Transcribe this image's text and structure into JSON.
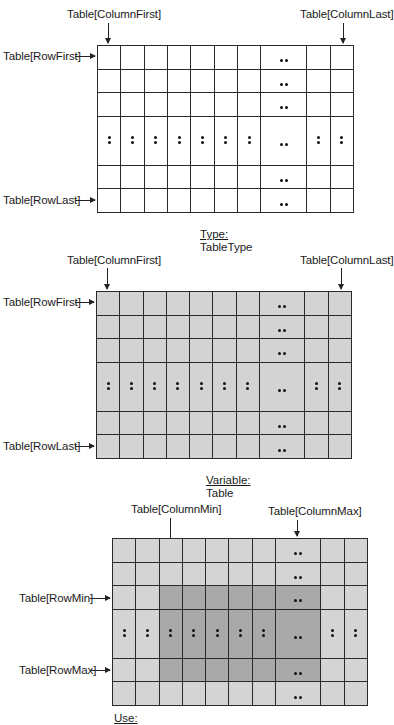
{
  "diagrams": [
    {
      "caption": {
        "kind": "Type:",
        "name": "TableType"
      },
      "labels": {
        "column_first": "Table[ColumnFirst]",
        "column_last": "Table[ColumnLast]",
        "row_first": "Table[RowFirst]",
        "row_last": "Table[RowLast]"
      },
      "fill": "#ffffff"
    },
    {
      "caption": {
        "kind": "Variable:",
        "name": "Table"
      },
      "labels": {
        "column_first": "Table[ColumnFirst]",
        "column_last": "Table[ColumnLast]",
        "row_first": "Table[RowFirst]",
        "row_last": "Table[RowLast]"
      },
      "fill": "#d3d3d3"
    },
    {
      "caption": {
        "kind": "Use:",
        "name": ""
      },
      "labels": {
        "column_min": "Table[ColumnMin]",
        "column_max": "Table[ColumnMax]",
        "row_min": "Table[RowMin]",
        "row_max": "Table[RowMax]"
      },
      "fill": "#d4d4d4",
      "highlight_fill": "#a9a9a9",
      "highlight": {
        "columns": [
          2,
          7
        ],
        "rows": [
          2,
          4
        ]
      }
    }
  ],
  "grid_structure": {
    "columns": [
      "c",
      "c",
      "c",
      "c",
      "c",
      "c",
      "c",
      "ellipsis",
      "c",
      "c"
    ],
    "rows": [
      "r",
      "r",
      "r",
      "ellipsis",
      "r",
      "r"
    ]
  }
}
